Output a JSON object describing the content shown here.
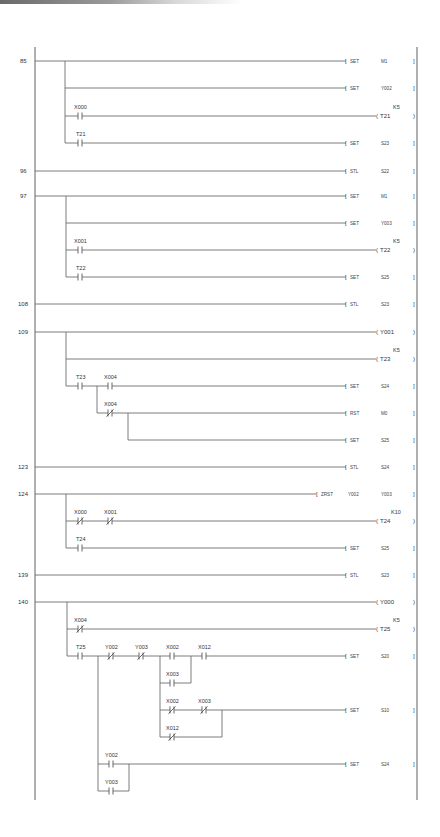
{
  "diagram": {
    "type": "ladder-logic",
    "left_bus_x": 35,
    "right_bus_x": 417,
    "branch_x": 65,
    "colors": {
      "wire": "#6e6e6e",
      "text": "#333333",
      "background": "#ffffff"
    },
    "rungs": [
      {
        "step": "85",
        "y": 61,
        "branches": [
          {
            "y": 61,
            "contacts": [],
            "output": {
              "kind": "instr",
              "op": "SET",
              "operands": [
                "M1"
              ]
            }
          },
          {
            "y": 88,
            "contacts": [],
            "output": {
              "kind": "instr",
              "op": "SET",
              "operands": [
                "Y002"
              ]
            }
          },
          {
            "y": 116,
            "contacts": [
              {
                "name": "X000",
                "type": "NO"
              }
            ],
            "output": {
              "kind": "coil",
              "name": "T21",
              "preset": "K5"
            }
          },
          {
            "y": 143,
            "contacts": [
              {
                "name": "T21",
                "type": "NO"
              }
            ],
            "output": {
              "kind": "instr",
              "op": "SET",
              "operands": [
                "S23"
              ]
            }
          }
        ]
      },
      {
        "step": "96",
        "y": 171,
        "branches": [
          {
            "y": 171,
            "contacts": [],
            "output": {
              "kind": "instr",
              "op": "STL",
              "operands": [
                "S22"
              ]
            }
          }
        ]
      },
      {
        "step": "97",
        "y": 196,
        "branches": [
          {
            "y": 196,
            "contacts": [],
            "output": {
              "kind": "instr",
              "op": "SET",
              "operands": [
                "M1"
              ]
            }
          },
          {
            "y": 223,
            "contacts": [],
            "output": {
              "kind": "instr",
              "op": "SET",
              "operands": [
                "Y003"
              ]
            }
          },
          {
            "y": 250,
            "contacts": [
              {
                "name": "X001",
                "type": "NO"
              }
            ],
            "output": {
              "kind": "coil",
              "name": "T22",
              "preset": "K5"
            }
          },
          {
            "y": 277,
            "contacts": [
              {
                "name": "T22",
                "type": "NO"
              }
            ],
            "output": {
              "kind": "instr",
              "op": "SET",
              "operands": [
                "S25"
              ]
            }
          }
        ]
      },
      {
        "step": "108",
        "y": 304,
        "branches": [
          {
            "y": 304,
            "contacts": [],
            "output": {
              "kind": "instr",
              "op": "STL",
              "operands": [
                "S23"
              ]
            }
          }
        ]
      },
      {
        "step": "109",
        "y": 332,
        "branches": [
          {
            "y": 332,
            "contacts": [],
            "output": {
              "kind": "coil",
              "name": "Y001",
              "preset": ""
            }
          },
          {
            "y": 359,
            "contacts": [],
            "output": {
              "kind": "coil",
              "name": "T23",
              "preset": "K5"
            }
          },
          {
            "y": 386,
            "contacts": [
              {
                "name": "T23",
                "type": "NO"
              },
              {
                "name": "X004",
                "type": "NO"
              }
            ],
            "output": {
              "kind": "instr",
              "op": "SET",
              "operands": [
                "S24"
              ]
            }
          },
          {
            "y": 413,
            "contacts": [
              {
                "name": "X004",
                "type": "NC"
              }
            ],
            "output": {
              "kind": "instr",
              "op": "RST",
              "operands": [
                "M0"
              ]
            }
          },
          {
            "y": 440,
            "contacts": [],
            "output": {
              "kind": "instr",
              "op": "SET",
              "operands": [
                "S25"
              ]
            }
          }
        ]
      },
      {
        "step": "123",
        "y": 467,
        "branches": [
          {
            "y": 467,
            "contacts": [],
            "output": {
              "kind": "instr",
              "op": "STL",
              "operands": [
                "S24"
              ]
            }
          }
        ]
      },
      {
        "step": "124",
        "y": 494,
        "branches": [
          {
            "y": 494,
            "contacts": [],
            "output": {
              "kind": "instr",
              "op": "ZRST",
              "operands": [
                "Y002",
                "Y003"
              ]
            }
          },
          {
            "y": 521,
            "contacts": [
              {
                "name": "X000",
                "type": "NC"
              },
              {
                "name": "X001",
                "type": "NC"
              }
            ],
            "output": {
              "kind": "coil",
              "name": "T24",
              "preset": "K10"
            }
          },
          {
            "y": 548,
            "contacts": [
              {
                "name": "T24",
                "type": "NO"
              }
            ],
            "output": {
              "kind": "instr",
              "op": "SET",
              "operands": [
                "S25"
              ]
            }
          }
        ]
      },
      {
        "step": "139",
        "y": 575,
        "branches": [
          {
            "y": 575,
            "contacts": [],
            "output": {
              "kind": "instr",
              "op": "STL",
              "operands": [
                "S23"
              ]
            }
          }
        ]
      },
      {
        "step": "140",
        "y": 602,
        "branches": [
          {
            "y": 602,
            "contacts": [],
            "output": {
              "kind": "coil",
              "name": "Y000",
              "preset": ""
            }
          },
          {
            "y": 629,
            "contacts": [
              {
                "name": "X004",
                "type": "NC"
              }
            ],
            "output": {
              "kind": "coil",
              "name": "T25",
              "preset": "K5"
            }
          },
          {
            "y": 656,
            "contacts": [
              {
                "name": "T25",
                "type": "NO"
              },
              {
                "name": "Y002",
                "type": "NC"
              },
              {
                "name": "Y003",
                "type": "NC"
              },
              {
                "name": "X002",
                "type": "NO"
              },
              {
                "name": "X012",
                "type": "NO"
              }
            ],
            "output": {
              "kind": "instr",
              "op": "SET",
              "operands": [
                "S20"
              ]
            }
          },
          {
            "y": 683,
            "contacts": [
              {
                "name": "X003",
                "type": "NO",
                "parallel_with": "X002"
              }
            ],
            "output": null
          },
          {
            "y": 710,
            "contacts": [
              {
                "name": "X002",
                "type": "NC"
              },
              {
                "name": "X003",
                "type": "NC"
              }
            ],
            "output": {
              "kind": "instr",
              "op": "SET",
              "operands": [
                "S10"
              ]
            }
          },
          {
            "y": 737,
            "contacts": [
              {
                "name": "X012",
                "type": "NC",
                "parallel_with": "X002,X003"
              }
            ],
            "output": null
          },
          {
            "y": 764,
            "contacts": [
              {
                "name": "Y002",
                "type": "NO"
              }
            ],
            "output": {
              "kind": "instr",
              "op": "SET",
              "operands": [
                "S24"
              ]
            }
          },
          {
            "y": 791,
            "contacts": [
              {
                "name": "Y003",
                "type": "NO",
                "parallel_with": "Y002"
              }
            ],
            "output": null
          }
        ]
      }
    ]
  },
  "labels": {
    "steps": [
      "85",
      "96",
      "97",
      "108",
      "109",
      "123",
      "124",
      "139",
      "140"
    ],
    "r85": {
      "set_m1": "SET",
      "m1": "M1",
      "set_y002": "SET",
      "y002": "Y002",
      "x000": "X000",
      "k5": "K5",
      "t21_coil": "T21",
      "t21": "T21",
      "set_s23": "SET",
      "s23": "S23"
    },
    "r96": {
      "stl": "STL",
      "s22": "S22"
    },
    "r97": {
      "set_m1": "SET",
      "m1": "M1",
      "set_y003": "SET",
      "y003": "Y003",
      "x001": "X001",
      "k5": "K5",
      "t22_coil": "T22",
      "t22": "T22",
      "set_s25": "SET",
      "s25": "S25"
    },
    "r108": {
      "stl": "STL",
      "s23": "S23"
    },
    "r109": {
      "y001": "Y001",
      "k5": "K5",
      "t23_coil": "T23",
      "t23": "T23",
      "x004_no": "X004",
      "set_s24": "SET",
      "s24": "S24",
      "x004_nc": "X004",
      "rst": "RST",
      "m0": "M0",
      "set_s25": "SET",
      "s25": "S25"
    },
    "r123": {
      "stl": "STL",
      "s24": "S24"
    },
    "r124": {
      "zrst": "ZRST",
      "y002": "Y002",
      "y003": "Y003",
      "x000": "X000",
      "x001": "X001",
      "k10": "K10",
      "t24_coil": "T24",
      "t24": "T24",
      "set_s25": "SET",
      "s25": "S25"
    },
    "r139": {
      "stl": "STL",
      "s23": "S23"
    },
    "r140": {
      "y000": "Y000",
      "x004": "X004",
      "k5": "K5",
      "t25_coil": "T25",
      "t25": "T25",
      "y002_nc": "Y002",
      "y003_nc": "Y003",
      "x002_no": "X002",
      "x012_no": "X012",
      "set_s20": "SET",
      "s20": "S20",
      "x003_no": "X003",
      "x002_nc": "X002",
      "x003_nc": "X003",
      "set_s10": "SET",
      "s10": "S10",
      "x012_nc": "X012",
      "y002_no": "Y002",
      "set_s24": "SET",
      "s24": "S24",
      "y003_no": "Y003"
    }
  }
}
